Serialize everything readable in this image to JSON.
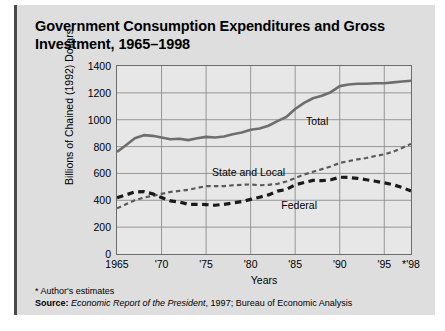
{
  "figure": {
    "title": "Government Consumption Expenditures and Gross Investment, 1965–1998",
    "footnote": "* Author's estimates",
    "source_label": "Source:",
    "source_italic": "Economic Report of the President",
    "source_rest": ", 1997; Bureau of Economic Analysis"
  },
  "colors": {
    "panel": "#dedede",
    "plot_bg": "#e7e7e7",
    "frame": "#6c6c6c",
    "grid": "#8d8d8d",
    "total": "#6e6e6e",
    "state_local": "#5a5a5a",
    "federal": "#1a1a1a"
  },
  "chart_data": {
    "type": "line",
    "title": "Government Consumption Expenditures and Gross Investment, 1965–1998",
    "xlabel": "Years",
    "ylabel": "Billions of Chained (1992) Dollars",
    "xlim": [
      1965,
      1998
    ],
    "ylim": [
      0,
      1400
    ],
    "yticks": [
      0,
      200,
      400,
      600,
      800,
      1000,
      1200,
      1400
    ],
    "xticks": [
      1965,
      1970,
      1975,
      1980,
      1985,
      1990,
      1995,
      1998
    ],
    "xticklabels": [
      "1965",
      "'70",
      "'75",
      "'80",
      "'85",
      "'90",
      "'95",
      "*'98"
    ],
    "grid": true,
    "legend": "inline-labels",
    "x": [
      1965,
      1966,
      1967,
      1968,
      1969,
      1970,
      1971,
      1972,
      1973,
      1974,
      1975,
      1976,
      1977,
      1978,
      1979,
      1980,
      1981,
      1982,
      1983,
      1984,
      1985,
      1986,
      1987,
      1988,
      1989,
      1990,
      1991,
      1992,
      1993,
      1994,
      1995,
      1996,
      1997,
      1998
    ],
    "series": [
      {
        "name": "Total",
        "label": "Total",
        "style": "solid",
        "values": [
          760,
          810,
          862,
          885,
          880,
          868,
          855,
          858,
          848,
          862,
          872,
          868,
          875,
          892,
          905,
          925,
          935,
          955,
          990,
          1020,
          1080,
          1125,
          1160,
          1178,
          1205,
          1250,
          1262,
          1268,
          1268,
          1272,
          1272,
          1278,
          1285,
          1290
        ]
      },
      {
        "name": "State and Local",
        "label": "State and Local",
        "style": "dashed-fine",
        "values": [
          340,
          370,
          400,
          420,
          432,
          448,
          462,
          470,
          478,
          492,
          505,
          505,
          505,
          512,
          515,
          518,
          512,
          515,
          522,
          540,
          565,
          592,
          612,
          632,
          652,
          678,
          692,
          705,
          715,
          730,
          742,
          762,
          790,
          820
        ]
      },
      {
        "name": "Federal",
        "label": "Federal",
        "style": "dashed-heavy",
        "values": [
          420,
          440,
          462,
          465,
          448,
          420,
          395,
          388,
          370,
          370,
          368,
          363,
          370,
          380,
          390,
          407,
          423,
          440,
          468,
          480,
          515,
          533,
          548,
          546,
          553,
          572,
          570,
          563,
          553,
          542,
          530,
          516,
          495,
          470
        ]
      }
    ]
  }
}
